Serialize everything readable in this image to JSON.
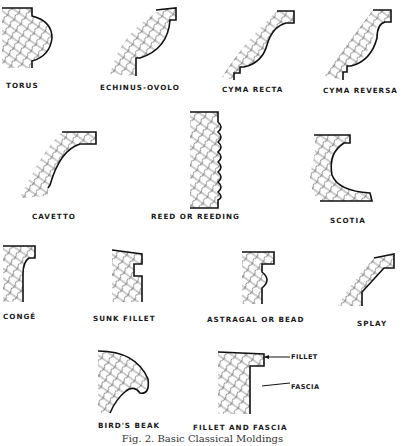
{
  "figure": {
    "caption": "Fig. 2. Basic Classical Moldings",
    "moldings": [
      {
        "id": "torus",
        "label": "TORUS"
      },
      {
        "id": "echinus-ovolo",
        "label": "ECHINUS-OVOLO"
      },
      {
        "id": "cyma-recta",
        "label": "CYMA RECTA"
      },
      {
        "id": "cyma-reversa",
        "label": "CYMA REVERSA"
      },
      {
        "id": "cavetto",
        "label": "CAVETTO"
      },
      {
        "id": "reed",
        "label": "REED OR REEDING"
      },
      {
        "id": "scotia",
        "label": "SCOTIA"
      },
      {
        "id": "conge",
        "label": "CONGÉ"
      },
      {
        "id": "sunk-fillet",
        "label": "SUNK FILLET"
      },
      {
        "id": "astragal",
        "label": "ASTRAGAL OR BEAD"
      },
      {
        "id": "splay",
        "label": "SPLAY"
      },
      {
        "id": "birds-beak",
        "label": "BIRD'S BEAK"
      },
      {
        "id": "fillet-fascia",
        "label": "FILLET AND FASCIA"
      }
    ],
    "callouts": {
      "fillet": "FILLET",
      "fascia": "FASCIA"
    }
  }
}
